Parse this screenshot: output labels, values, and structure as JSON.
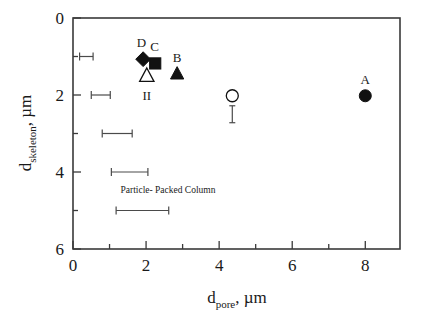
{
  "chart_data": {
    "type": "scatter",
    "title": "",
    "xlabel": "d_pore, µm",
    "ylabel": "d_skeleton, µm",
    "xlabel_main": "d",
    "xlabel_sub": "pore",
    "xlabel_tail": ", µm",
    "ylabel_main": "d",
    "ylabel_sub": "skeleton",
    "ylabel_tail": ", µm",
    "xlim": [
      0,
      8.95
    ],
    "ylim": [
      0,
      6
    ],
    "y_inverted": true,
    "grid": false,
    "legend": "none",
    "x_ticks": [
      0,
      2,
      4,
      6,
      8
    ],
    "x_tick_labels": [
      "0",
      "2",
      "4",
      "6",
      "8"
    ],
    "x_minor_ticks": [
      1,
      3,
      5,
      7
    ],
    "y_ticks": [
      0,
      2,
      4,
      6
    ],
    "y_tick_labels": [
      "0",
      "2",
      "4",
      "6"
    ],
    "y_minor_ticks": [
      1,
      3,
      5
    ],
    "points": [
      {
        "label": "A",
        "marker": "filled-circle",
        "x": 8.0,
        "y": 2.02,
        "label_dx": 0,
        "label_dy": -0.42
      },
      {
        "label": "B",
        "marker": "filled-triangle",
        "x": 2.85,
        "y": 1.45,
        "label_dx": 0,
        "label_dy": -0.42
      },
      {
        "label": "C",
        "marker": "filled-square",
        "x": 2.25,
        "y": 1.18,
        "label_dx": -0.02,
        "label_dy": -0.42
      },
      {
        "label": "D",
        "marker": "filled-diamond",
        "x": 1.92,
        "y": 1.07,
        "label_dx": -0.05,
        "label_dy": -0.42
      },
      {
        "label": "II",
        "marker": "open-triangle",
        "x": 2.02,
        "y": 1.5,
        "label_dx": 0,
        "label_dy": 0.52
      },
      {
        "label": "",
        "marker": "open-circle",
        "x": 4.36,
        "y": 2.02,
        "label_dx": 0,
        "label_dy": 0
      }
    ],
    "vertical_error_bars": [
      {
        "x": 4.36,
        "y_top": 2.28,
        "y_bottom": 2.72
      }
    ],
    "particle_packed_column": {
      "annotation": "Particle- Packed Column",
      "annotation_x": 2.6,
      "annotation_y": 4.55,
      "error_bars": [
        {
          "y": 1.0,
          "x_low": 0.18,
          "x_high": 0.55
        },
        {
          "y": 2.0,
          "x_low": 0.5,
          "x_high": 1.02
        },
        {
          "y": 3.0,
          "x_low": 0.8,
          "x_high": 1.62
        },
        {
          "y": 4.0,
          "x_low": 1.05,
          "x_high": 2.05
        },
        {
          "y": 5.0,
          "x_low": 1.18,
          "x_high": 2.62
        }
      ]
    }
  }
}
